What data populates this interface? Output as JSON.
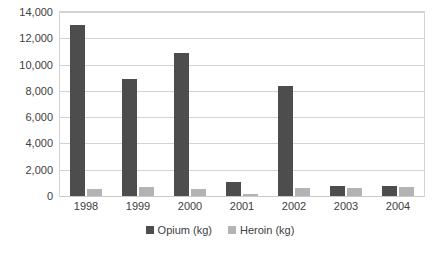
{
  "chart_data": {
    "type": "bar",
    "title": "",
    "subtitle": "",
    "xlabel": "",
    "ylabel": "",
    "categories": [
      "1998",
      "1999",
      "2000",
      "2001",
      "2002",
      "2003",
      "2004"
    ],
    "series": [
      {
        "name": "Opium (kg)",
        "color": "#4d4d4d",
        "values": [
          13000,
          8900,
          10900,
          1100,
          8400,
          750,
          750
        ]
      },
      {
        "name": "Heroin (kg)",
        "color": "#b3b3b3",
        "values": [
          500,
          650,
          500,
          150,
          600,
          600,
          650
        ]
      }
    ],
    "ylim": [
      0,
      14000
    ],
    "ytick_step": 2000,
    "ytick_labels": [
      "0",
      "2,000",
      "4,000",
      "6,000",
      "8,000",
      "10,000",
      "12,000",
      "14,000"
    ],
    "ytick_values": [
      0,
      2000,
      4000,
      6000,
      8000,
      10000,
      12000,
      14000
    ],
    "grid": true,
    "grid_axis": "y",
    "legend": true,
    "legend_position": "bottom",
    "plot_border_color": "#d3d3d3",
    "grid_color": "#d3d3d3",
    "background_color": "#ffffff"
  }
}
